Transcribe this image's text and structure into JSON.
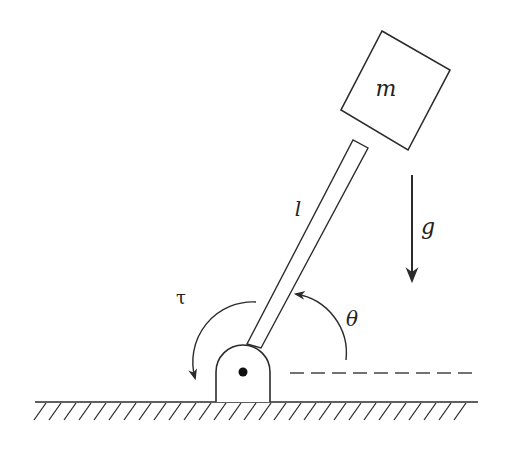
{
  "diagram": {
    "type": "inverted-pendulum",
    "labels": {
      "mass": "m",
      "length": "l",
      "gravity": "g",
      "torque": "τ",
      "angle": "θ"
    },
    "colors": {
      "stroke": "#2b2b2b",
      "background": "#ffffff"
    }
  }
}
